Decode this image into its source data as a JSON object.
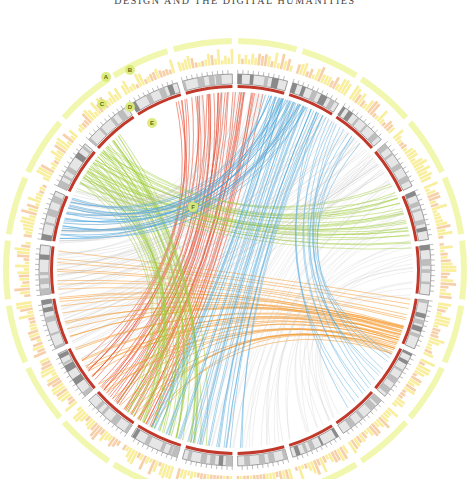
{
  "header": {
    "running_title": "DESIGN AND THE DIGITAL HUMANITIES"
  },
  "diagram": {
    "type": "circos-chord",
    "center": [
      235,
      270
    ],
    "radii": {
      "chords": 178,
      "red_ring": 182,
      "ideogram_inner": 186,
      "ideogram_outer": 196,
      "ticks": 200,
      "hist_inner": 206,
      "hist_outer": 222,
      "halo": 232,
      "labels": 240
    },
    "colors": {
      "red_ring": "#c0392b",
      "ideogram": "#bdbdbd",
      "ideogram_band_dark": "#8a8a8a",
      "tick": "#555555",
      "histogram": "#f2e04a",
      "histogram_orange": "#f0a860",
      "halo": "#eef59a",
      "grey_links": "#bfbfbf",
      "red_links": "#e8462a",
      "orange_links": "#f5921e",
      "green_links": "#9fcc3b",
      "blue_links": "#4aa6dc",
      "callout_fill": "#d9ea74"
    },
    "callouts": [
      {
        "label": "A",
        "x": 106,
        "y": 77
      },
      {
        "label": "B",
        "x": 130,
        "y": 70
      },
      {
        "label": "C",
        "x": 102,
        "y": 104
      },
      {
        "label": "D",
        "x": 130,
        "y": 107
      },
      {
        "label": "E",
        "x": 152,
        "y": 123
      },
      {
        "label": "F",
        "x": 193,
        "y": 207
      }
    ],
    "segments": 22,
    "link_bundles": [
      {
        "name": "red",
        "color_key": "red_links",
        "from_deg": [
          -152,
          -122
        ],
        "to_deg": [
          -18,
          8
        ],
        "count": 40,
        "opacity": 0.7
      },
      {
        "name": "orange",
        "color_key": "orange_links",
        "from_deg": [
          -150,
          -100
        ],
        "to_deg": [
          108,
          118
        ],
        "count": 28,
        "opacity": 0.65
      },
      {
        "name": "orange2",
        "color_key": "orange_links",
        "from_deg": [
          -100,
          -84
        ],
        "to_deg": [
          100,
          112
        ],
        "count": 10,
        "opacity": 0.6
      },
      {
        "name": "green",
        "color_key": "green_links",
        "from_deg": [
          -170,
          -140
        ],
        "to_deg": [
          -60,
          -40
        ],
        "count": 36,
        "opacity": 0.65
      },
      {
        "name": "green2",
        "color_key": "green_links",
        "from_deg": [
          -62,
          -46
        ],
        "to_deg": [
          62,
          82
        ],
        "count": 26,
        "opacity": 0.6
      },
      {
        "name": "blue",
        "color_key": "blue_links",
        "from_deg": [
          -80,
          -66
        ],
        "to_deg": [
          10,
          24
        ],
        "count": 24,
        "opacity": 0.7
      },
      {
        "name": "blue2",
        "color_key": "blue_links",
        "from_deg": [
          178,
          210
        ],
        "to_deg": [
          12,
          30
        ],
        "count": 30,
        "opacity": 0.6
      },
      {
        "name": "blue3",
        "color_key": "blue_links",
        "from_deg": [
          28,
          44
        ],
        "to_deg": [
          118,
          140
        ],
        "count": 14,
        "opacity": 0.55
      },
      {
        "name": "grey",
        "color_key": "grey_links",
        "from_deg": [
          -120,
          -60
        ],
        "to_deg": [
          -10,
          60
        ],
        "count": 70,
        "opacity": 0.35
      },
      {
        "name": "grey2",
        "color_key": "grey_links",
        "from_deg": [
          140,
          200
        ],
        "to_deg": [
          40,
          100
        ],
        "count": 40,
        "opacity": 0.3
      }
    ]
  }
}
